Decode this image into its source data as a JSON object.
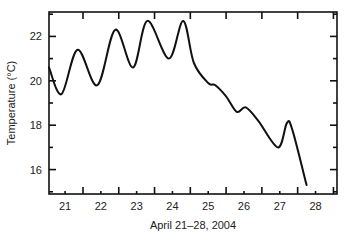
{
  "chart_data": {
    "type": "line",
    "title": "",
    "xlabel": "April 21–28, 2004",
    "ylabel": "Temperature (°C)",
    "xlim": [
      20.55,
      28.6
    ],
    "ylim": [
      14.9,
      23.1
    ],
    "x_ticks": [
      21,
      22,
      23,
      24,
      25,
      26,
      27,
      28
    ],
    "y_ticks": [
      16,
      18,
      20,
      22
    ],
    "grid": false,
    "legend": null,
    "series": [
      {
        "name": "Temperature",
        "color": "#111111",
        "x": [
          20.55,
          20.9,
          21.35,
          21.9,
          22.4,
          22.9,
          23.3,
          23.9,
          24.3,
          24.6,
          25.0,
          25.2,
          25.5,
          25.8,
          26.05,
          26.4,
          26.95,
          27.2,
          27.35,
          27.75
        ],
        "y": [
          20.6,
          19.4,
          21.4,
          19.8,
          22.3,
          20.6,
          22.7,
          21.0,
          22.7,
          20.8,
          19.9,
          19.8,
          19.3,
          18.6,
          18.8,
          18.2,
          17.0,
          18.1,
          17.8,
          15.3
        ]
      }
    ]
  }
}
